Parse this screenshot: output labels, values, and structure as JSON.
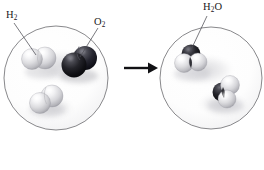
{
  "diagram": {
    "type": "chemical-reaction-illustration",
    "background_color": "#ffffff",
    "outline_color": "#7a7a7e",
    "labels": [
      {
        "id": "h2",
        "formula": "H",
        "subscript": "2",
        "suffix": "",
        "text": "H2",
        "x": 6,
        "y": 10
      },
      {
        "id": "o2",
        "formula": "O",
        "subscript": "2",
        "suffix": "",
        "text": "O2",
        "x": 94,
        "y": 17
      },
      {
        "id": "h2o",
        "formula": "H",
        "subscript": "2",
        "suffix": "O",
        "text": "H2O",
        "x": 203,
        "y": 2
      }
    ],
    "reactant_container": {
      "name": "reactants-circle",
      "cx": 56,
      "cy": 78,
      "r": 52,
      "molecules": [
        {
          "name": "hydrogen-molecule-upper",
          "formula": "H2",
          "atoms": [
            "H",
            "H"
          ],
          "atom_color": "#d9d9dc"
        },
        {
          "name": "oxygen-molecule",
          "formula": "O2",
          "atoms": [
            "O",
            "O"
          ],
          "atom_color": "#17171a"
        },
        {
          "name": "hydrogen-molecule-lower",
          "formula": "H2",
          "atoms": [
            "H",
            "H"
          ],
          "atom_color": "#d9d9dc"
        }
      ]
    },
    "product_container": {
      "name": "products-circle",
      "cx": 211,
      "cy": 78,
      "r": 51,
      "molecules": [
        {
          "name": "water-molecule-upper",
          "formula": "H2O",
          "atoms": [
            "O",
            "H",
            "H"
          ],
          "oxygen_color": "#1c1c20",
          "hydrogen_color": "#d9d9dc"
        },
        {
          "name": "water-molecule-lower",
          "formula": "H2O",
          "atoms": [
            "O",
            "H",
            "H"
          ],
          "oxygen_color": "#1c1c20",
          "hydrogen_color": "#d9d9dc"
        }
      ]
    },
    "arrow": {
      "name": "reaction-arrow",
      "direction": "right",
      "x1": 124,
      "x2": 156,
      "y": 68,
      "color": "#111114"
    },
    "colors": {
      "hydrogen_atom": "#d9d9dc",
      "oxygen_atom": "#17171a",
      "circle_outline": "#7a7a7e",
      "leader_line": "#4e4e54",
      "text": "#18181a",
      "shadow": "#cfcfd2"
    }
  }
}
